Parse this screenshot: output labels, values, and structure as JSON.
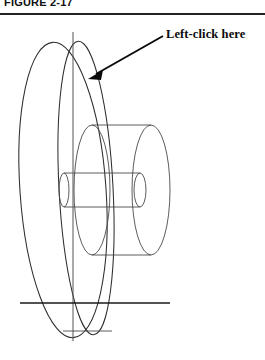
{
  "figure": {
    "caption": "FIGURE 2-17",
    "annotation": {
      "label": "Left-click here",
      "leader_from": [
        163,
        36
      ],
      "leader_to": [
        91,
        77
      ],
      "points_at": "flywheel-rim-edge"
    },
    "drawing": {
      "title": "Wireframe pulley with hub and shaft",
      "type": "cad-wireframe",
      "colors": {
        "line": "#4a4a4a",
        "line_dark": "#2e2e2e",
        "axis": "#1a1a1a",
        "annotation": "#0b0b0b",
        "rule": "#222222",
        "background": "#ffffff"
      },
      "parts": [
        {
          "name": "outer-disc-front-face",
          "shape": "ellipse",
          "cx": 63,
          "cy": 190,
          "rx": 43,
          "ry": 148,
          "rotation": -4
        },
        {
          "name": "outer-disc-back-face",
          "shape": "ellipse",
          "cx": 85,
          "cy": 188,
          "rx": 27,
          "ry": 147,
          "rotation": -3
        },
        {
          "name": "hub-front-face",
          "shape": "ellipse",
          "cx": 92,
          "cy": 190,
          "rx": 18,
          "ry": 65
        },
        {
          "name": "hub-back-face",
          "shape": "ellipse",
          "cx": 150,
          "cy": 190,
          "rx": 19,
          "ry": 65
        },
        {
          "name": "hub-top-edge",
          "shape": "line",
          "x1": 92,
          "y1": 125,
          "x2": 150,
          "y2": 125
        },
        {
          "name": "hub-bottom-edge",
          "shape": "line",
          "x1": 92,
          "y1": 255,
          "x2": 150,
          "y2": 255
        },
        {
          "name": "shaft-front-face",
          "shape": "ellipse",
          "cx": 64,
          "cy": 190,
          "rx": 5,
          "ry": 17
        },
        {
          "name": "shaft-back-face",
          "shape": "ellipse",
          "cx": 139,
          "cy": 190,
          "rx": 6,
          "ry": 17
        },
        {
          "name": "shaft-top-edge",
          "shape": "line",
          "x1": 64,
          "y1": 173,
          "x2": 139,
          "y2": 173
        },
        {
          "name": "shaft-bottom-edge",
          "shape": "line",
          "x1": 64,
          "y1": 207,
          "x2": 139,
          "y2": 207
        },
        {
          "name": "vertical-centerline",
          "shape": "line",
          "x1": 73,
          "y1": 32,
          "x2": 73,
          "y2": 341
        },
        {
          "name": "horizontal-axis-line",
          "shape": "line",
          "x1": 20,
          "y1": 303,
          "x2": 170,
          "y2": 303
        },
        {
          "name": "lower-tangent-line",
          "shape": "line",
          "x1": 63,
          "y1": 331,
          "x2": 112,
          "y2": 331
        }
      ]
    }
  }
}
